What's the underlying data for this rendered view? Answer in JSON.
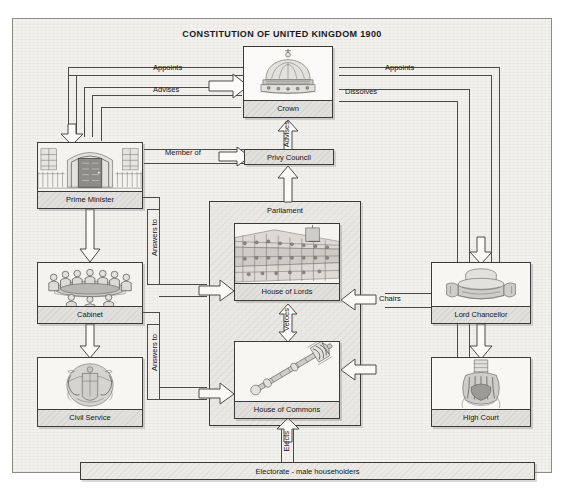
{
  "title": "CONSTITUTION OF UNITED KINGDOM 1900",
  "nodes": {
    "crown": "Crown",
    "privy_council": "Privy Council",
    "prime_minister": "Prime Minister",
    "cabinet": "Cabinet",
    "civil_service": "Civil Service",
    "parliament": "Parliament",
    "house_of_lords": "House of Lords",
    "house_of_commons": "House of Commons",
    "lord_chancellor": "Lord Chancellor",
    "high_court": "High Court",
    "electorate": "Electorate - male householders"
  },
  "edges": {
    "appoints_left": "Appoints",
    "advises_left": "Advises",
    "member_of": "Member of",
    "appoints_right": "Appoints",
    "dissolves": "Dissolves",
    "advises_up": "Advises",
    "answers_to_lords": "Answers to",
    "answers_to_commons": "Answers to",
    "vetoes": "Vetoes",
    "chairs": "Chairs",
    "elects": "Elects"
  },
  "colors": {
    "paper": "#f2f1ee",
    "ink": "#4a4a4a",
    "caption_bg": "#e2e0dc",
    "node_bg": "#fbfaf8",
    "border": "#3b3b3b"
  }
}
